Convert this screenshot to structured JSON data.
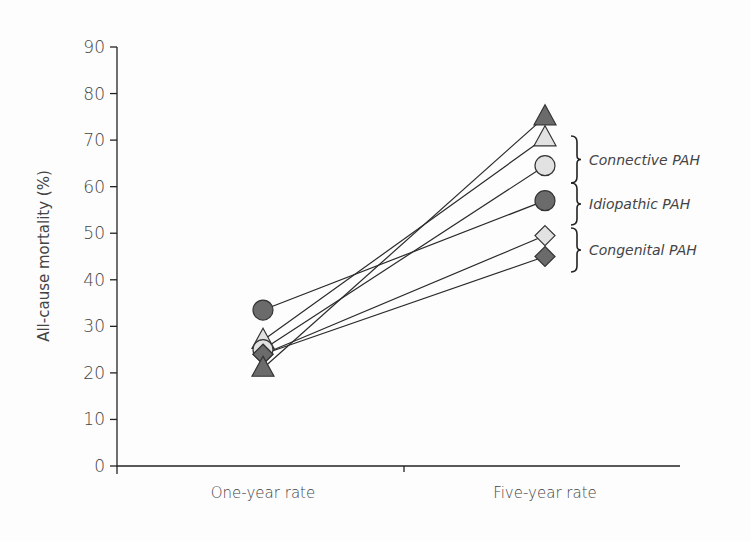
{
  "chart_data": {
    "type": "line",
    "title": "",
    "xlabel": "",
    "ylabel": "All-cause mortality (%)",
    "categories": [
      "One-year rate",
      "Five-year rate"
    ],
    "ylim": [
      0,
      90
    ],
    "yticks": [
      0,
      10,
      20,
      30,
      40,
      50,
      60,
      70,
      80,
      90
    ],
    "grid": false,
    "legend_position": "right (bracketed group labels)",
    "series": [
      {
        "name": "Connective PAH (dark triangle)",
        "group": "Connective PAH",
        "marker": "triangle",
        "fill": "#6b6b6b",
        "values": [
          21,
          75
        ]
      },
      {
        "name": "Connective PAH (light triangle)",
        "group": "Connective PAH",
        "marker": "triangle",
        "fill": "#e2e2e2",
        "values": [
          27,
          70.5
        ]
      },
      {
        "name": "Idiopathic PAH (light circle)",
        "group": "Idiopathic PAH",
        "marker": "circle",
        "fill": "#e2e2e2",
        "values": [
          25,
          64.5
        ]
      },
      {
        "name": "Idiopathic PAH (dark circle)",
        "group": "Idiopathic PAH",
        "marker": "circle",
        "fill": "#6b6b6b",
        "values": [
          33.5,
          57
        ]
      },
      {
        "name": "Congenital PAH (light diamond)",
        "group": "Congenital PAH",
        "marker": "diamond",
        "fill": "#e2e2e2",
        "values": [
          24,
          49.5
        ]
      },
      {
        "name": "Congenital PAH (dark diamond)",
        "group": "Congenital PAH",
        "marker": "diamond",
        "fill": "#6b6b6b",
        "values": [
          24,
          45
        ]
      }
    ],
    "annotations": [
      "Connective PAH",
      "Idiopathic PAH",
      "Congenital PAH"
    ]
  },
  "labels": {
    "ylabel": "All-cause mortality (%)",
    "x0": "One-year rate",
    "x1": "Five-year rate",
    "groups": [
      "Connective PAH",
      "Idiopathic PAH",
      "Congenital PAH"
    ]
  }
}
